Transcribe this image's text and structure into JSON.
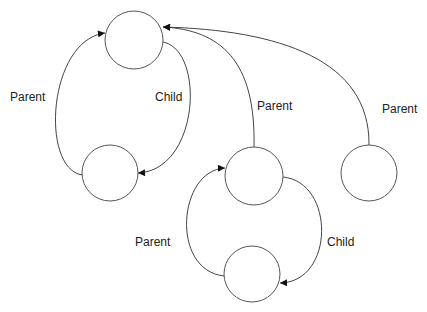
{
  "diagram": {
    "type": "tree-with-parent-child-links",
    "colors": {
      "stroke": "#444444",
      "node_fill": "#ffffff",
      "text": "#222222"
    },
    "nodes": [
      {
        "id": "n1",
        "cx": 134,
        "cy": 40,
        "r": 29
      },
      {
        "id": "n2",
        "cx": 110,
        "cy": 173,
        "r": 28
      },
      {
        "id": "n3",
        "cx": 254,
        "cy": 176,
        "r": 29
      },
      {
        "id": "n4",
        "cx": 369,
        "cy": 173,
        "r": 28
      },
      {
        "id": "n5",
        "cx": 252,
        "cy": 274,
        "r": 28
      }
    ],
    "edges": [
      {
        "from": "n2",
        "to": "n1",
        "label": "Parent"
      },
      {
        "from": "n1",
        "to": "n2",
        "label": "Child"
      },
      {
        "from": "n3",
        "to": "n1",
        "label": "Parent"
      },
      {
        "from": "n4",
        "to": "n1",
        "label": "Parent"
      },
      {
        "from": "n5",
        "to": "n3",
        "label": "Parent"
      },
      {
        "from": "n3",
        "to": "n5",
        "label": "Child"
      }
    ],
    "labels": {
      "left_parent": "Parent",
      "left_child": "Child",
      "mid_parent": "Parent",
      "right_parent": "Parent",
      "bottom_parent": "Parent",
      "bottom_child": "Child"
    }
  }
}
